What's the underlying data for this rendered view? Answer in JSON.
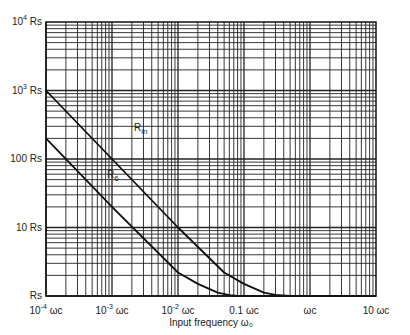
{
  "chart_data": {
    "type": "line",
    "title": "",
    "xlabel": "Input frequency ω₀",
    "ylabel": "",
    "x_scale": "log",
    "y_scale": "log",
    "xlim": [
      0.0001,
      10
    ],
    "ylim": [
      1,
      10000
    ],
    "grid": true,
    "x_ticks": [
      {
        "value": 0.0001,
        "base": "10",
        "exp": "-4",
        "unit": "ωc"
      },
      {
        "value": 0.001,
        "base": "10",
        "exp": "-3",
        "unit": "ωc"
      },
      {
        "value": 0.01,
        "base": "10",
        "exp": "-2",
        "unit": "ωc"
      },
      {
        "value": 0.1,
        "base": "0.1",
        "exp": "",
        "unit": "ωc"
      },
      {
        "value": 1,
        "base": "",
        "exp": "",
        "unit": "ωc"
      },
      {
        "value": 10,
        "base": "10",
        "exp": "",
        "unit": "ωc"
      }
    ],
    "y_ticks": [
      {
        "value": 10000,
        "base": "10",
        "exp": "4",
        "unit": "Rs"
      },
      {
        "value": 1000,
        "base": "10",
        "exp": "3",
        "unit": "Rs"
      },
      {
        "value": 100,
        "base": "100",
        "exp": "",
        "unit": "Rs"
      },
      {
        "value": 10,
        "base": "10",
        "exp": "",
        "unit": "Rs"
      },
      {
        "value": 1,
        "base": "",
        "exp": "",
        "unit": "Rs"
      }
    ],
    "series": [
      {
        "name": "Rin",
        "label_main": "R",
        "label_sub": "in",
        "x": [
          0.0001,
          0.001,
          0.01,
          0.05,
          0.1,
          0.2,
          0.3,
          0.5,
          1,
          10
        ],
        "y": [
          1000,
          100,
          10,
          2.2,
          1.5,
          1.12,
          1.04,
          1.0,
          1.0,
          1.0
        ]
      },
      {
        "name": "R6",
        "label_main": "R",
        "label_sub": "6",
        "x": [
          0.0001,
          0.001,
          0.01,
          0.02,
          0.04,
          0.06,
          0.08,
          0.1,
          1,
          10
        ],
        "y": [
          200,
          20,
          2.2,
          1.5,
          1.12,
          1.03,
          1.0,
          1.0,
          1.0,
          1.0
        ]
      }
    ]
  }
}
